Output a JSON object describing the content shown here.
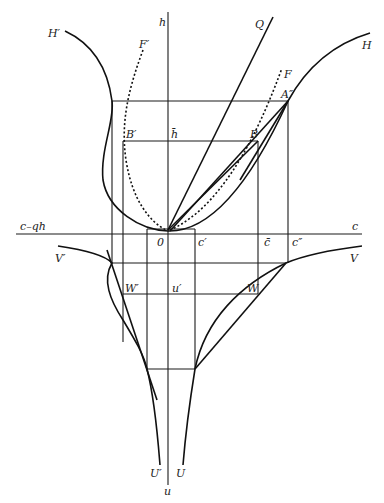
{
  "figure": {
    "type": "geometric construction diagram",
    "axes": {
      "vertical_top": "h",
      "vertical_bottom": "u",
      "horizontal_right": "c",
      "horizontal_left": "c–qh",
      "origin": "0"
    },
    "curve_labels": {
      "H_prime": "H′",
      "H": "H",
      "F_prime": "F′",
      "F": "F",
      "Q": "Q",
      "V_prime": "V′",
      "V": "V",
      "U_prime": "U′",
      "U": "U"
    },
    "point_labels": {
      "A_dprime": "A″",
      "B": "B",
      "B_prime": "B′",
      "h_bar": "h̄",
      "c_prime": "c′",
      "c_bar": "c̄",
      "c_dprime": "c″",
      "W": "W",
      "W_prime": "W′",
      "u_prime": "u′"
    }
  }
}
